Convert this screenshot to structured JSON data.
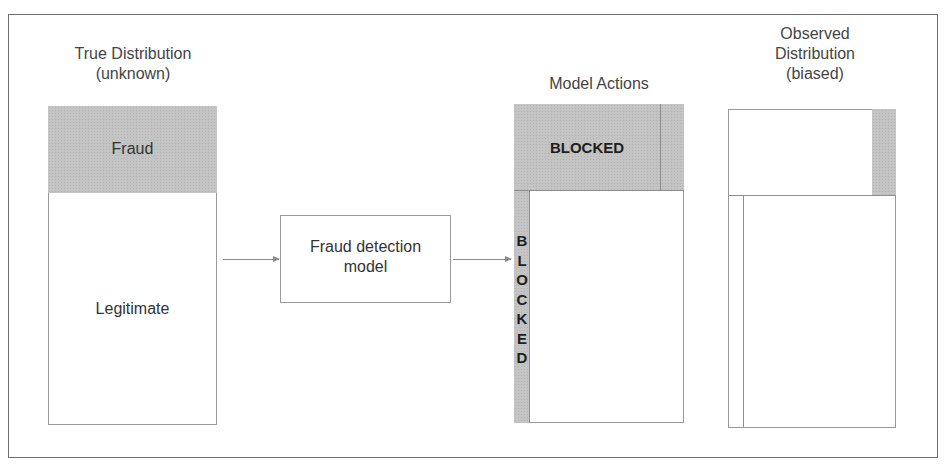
{
  "diagram": {
    "true_distribution": {
      "title_line1": "True Distribution",
      "title_line2": "(unknown)",
      "fraud_label": "Fraud",
      "legitimate_label": "Legitimate"
    },
    "model": {
      "label_line1": "Fraud detection",
      "label_line2": "model"
    },
    "model_actions": {
      "title": "Model Actions",
      "blocked_horizontal": "BLOCKED",
      "blocked_vertical_letters": [
        "B",
        "L",
        "O",
        "C",
        "K",
        "E",
        "D"
      ]
    },
    "observed_distribution": {
      "title_line1": "Observed",
      "title_line2": "Distribution",
      "title_line3": "(biased)"
    },
    "colors": {
      "fraud_fill": "#c4c4c4",
      "border": "#9a9a9a",
      "frame": "#6e6e6e"
    }
  }
}
